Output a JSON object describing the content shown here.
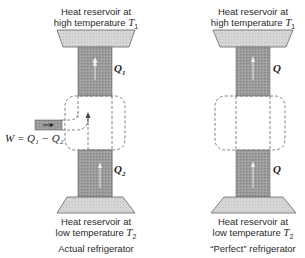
{
  "left_panel": {
    "top_reservoir": {
      "line1": "Heat reservoir at",
      "line2_prefix": "high temperature ",
      "temp_symbol": "T",
      "temp_sub": "1"
    },
    "upper_flow_label": {
      "symbol": "Q",
      "sub": "1"
    },
    "work_label": "W = Q₁ − Q₂",
    "lower_flow_label": {
      "symbol": "Q",
      "sub": "2"
    },
    "bottom_reservoir": {
      "line1": "Heat reservoir at",
      "line2_prefix": "low temperature ",
      "temp_symbol": "T",
      "temp_sub": "2"
    },
    "caption": "Actual refrigerator"
  },
  "right_panel": {
    "top_reservoir": {
      "line1": "Heat reservoir at",
      "line2_prefix": "high temperature ",
      "temp_symbol": "T",
      "temp_sub": "1"
    },
    "upper_flow_label": {
      "symbol": "Q"
    },
    "lower_flow_label": {
      "symbol": "Q"
    },
    "bottom_reservoir": {
      "line1": "Heat reservoir at",
      "line2_prefix": "low temperature ",
      "temp_symbol": "T",
      "temp_sub": "2"
    },
    "caption": "“Perfect” refrigerator"
  },
  "colors": {
    "reservoir_fill": "#d4d4d4",
    "column_fill": "#9a9a9a",
    "outline": "#555555",
    "dashed": "#666666"
  }
}
